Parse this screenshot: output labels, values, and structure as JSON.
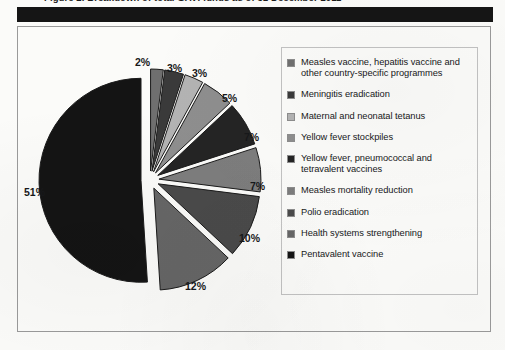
{
  "caption": {
    "text": "Figure 2. Breakdown of total GAVI funds as of 31 December 2011"
  },
  "chart_data": {
    "type": "pie",
    "title": "",
    "legend_position": "right",
    "exploded": true,
    "start_angle_deg": -90,
    "categories": [
      "Measles vaccine, hepatitis vaccine and other country-specific programmes",
      "Meningitis eradication",
      "Maternal and neonatal tetanus",
      "Yellow fever stockpiles",
      "Yellow fever, pneumococcal and tetravalent vaccines",
      "Measles mortality reduction",
      "Polio eradication",
      "Health systems strengthening",
      "Pentavalent vaccine"
    ],
    "values": [
      2,
      3,
      3,
      5,
      7,
      7,
      10,
      12,
      51
    ],
    "value_labels": [
      "2%",
      "3%",
      "3%",
      "5%",
      "7%",
      "7%",
      "10%",
      "12%",
      "51%"
    ],
    "unit": "%",
    "colors": [
      "#6f6f6f",
      "#3a3a3a",
      "#b3b3b3",
      "#8e8e8e",
      "#242424",
      "#7d7d7d",
      "#4a4a4a",
      "#666666",
      "#141414"
    ],
    "slice_border_color": "#1a1a1a",
    "gap_color": "#fbfbf9"
  },
  "legend": {
    "items": [
      {
        "label": "Measles vaccine, hepatitis vaccine and other country-specific programmes",
        "color": "#6f6f6f"
      },
      {
        "label": "Meningitis eradication",
        "color": "#3a3a3a"
      },
      {
        "label": "Maternal and neonatal tetanus",
        "color": "#b3b3b3"
      },
      {
        "label": "Yellow fever stockpiles",
        "color": "#8e8e8e"
      },
      {
        "label": "Yellow fever, pneumococcal and tetravalent vaccines",
        "color": "#242424"
      },
      {
        "label": "Measles mortality reduction",
        "color": "#7d7d7d"
      },
      {
        "label": "Polio eradication",
        "color": "#4a4a4a"
      },
      {
        "label": "Health systems strengthening",
        "color": "#666666"
      },
      {
        "label": "Pentavalent vaccine",
        "color": "#141414"
      }
    ]
  },
  "pie_labels": [
    {
      "text": "2%",
      "left": 113,
      "top": 9
    },
    {
      "text": "3%",
      "left": 145,
      "top": 15
    },
    {
      "text": "3%",
      "left": 170,
      "top": 20
    },
    {
      "text": "5%",
      "left": 200,
      "top": 45
    },
    {
      "text": "7%",
      "left": 222,
      "top": 84
    },
    {
      "text": "7%",
      "left": 228,
      "top": 133
    },
    {
      "text": "10%",
      "left": 217,
      "top": 185
    },
    {
      "text": "12%",
      "left": 163,
      "top": 233
    },
    {
      "text": "51%",
      "left": 2,
      "top": 139
    }
  ]
}
